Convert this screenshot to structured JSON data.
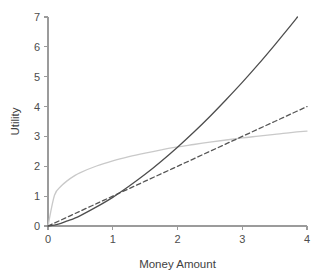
{
  "chart_data": {
    "type": "line",
    "title": "",
    "subtitle": "",
    "xlabel": "Money Amount",
    "ylabel": "Utility",
    "xlim": [
      0,
      4
    ],
    "ylim": [
      0,
      7
    ],
    "xticks": [
      0,
      1,
      2,
      3,
      4
    ],
    "yticks": [
      0,
      1,
      2,
      3,
      4,
      5,
      6,
      7
    ],
    "xtick_labels": [
      "0",
      "1",
      "2",
      "3",
      "4"
    ],
    "ytick_labels": [
      "0",
      "1",
      "2",
      "3",
      "4",
      "5",
      "6",
      "7"
    ],
    "grid": false,
    "legend": null,
    "legend_position": "none",
    "annotations": [],
    "x": [
      0,
      0.1,
      0.2,
      0.3,
      0.4,
      0.5,
      0.75,
      1,
      1.25,
      1.5,
      1.75,
      2,
      2.25,
      2.5,
      2.75,
      3,
      3.25,
      3.5,
      3.75,
      4
    ],
    "series": [
      {
        "name": "concave-utility",
        "label": "Concave (risk averse)",
        "style": "solid",
        "color": "#c9c9c9",
        "width": 1.3,
        "values": [
          0,
          1.03,
          1.33,
          1.52,
          1.67,
          1.79,
          2.01,
          2.18,
          2.32,
          2.44,
          2.55,
          2.65,
          2.73,
          2.81,
          2.88,
          2.95,
          3.01,
          3.07,
          3.13,
          3.18
        ]
      },
      {
        "name": "linear-utility",
        "label": "Linear (risk neutral)",
        "style": "dashed",
        "color": "#555555",
        "width": 1.3,
        "values": [
          0,
          0.1,
          0.2,
          0.3,
          0.4,
          0.5,
          0.75,
          1,
          1.25,
          1.5,
          1.75,
          2,
          2.25,
          2.5,
          2.75,
          3,
          3.25,
          3.5,
          3.75,
          4
        ]
      },
      {
        "name": "convex-utility",
        "label": "Convex (risk seeking)",
        "style": "solid",
        "color": "#4d4d4d",
        "width": 1.3,
        "values": [
          0,
          0.03,
          0.09,
          0.17,
          0.25,
          0.35,
          0.64,
          0.96,
          1.33,
          1.73,
          2.17,
          2.64,
          3.14,
          3.67,
          4.23,
          4.81,
          5.42,
          6.06,
          6.72,
          7.4
        ]
      }
    ],
    "axis_color": "#9b9b9b",
    "background_color": "#ffffff"
  }
}
